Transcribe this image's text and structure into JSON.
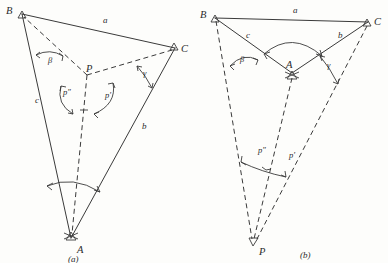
{
  "figure": {
    "background_color": "#fdfdfb",
    "ink_color": "#3a3a3a",
    "panels": [
      {
        "id": "a",
        "caption": "(a)",
        "description": "Triangle ABC with interior point P; angles p″ and p′ at P",
        "vertices": [
          {
            "name": "B",
            "label": "B",
            "x": 22,
            "y": 14
          },
          {
            "name": "C",
            "label": "C",
            "x": 175,
            "y": 48
          },
          {
            "name": "A",
            "label": "A",
            "x": 71,
            "y": 238
          },
          {
            "name": "P",
            "label": "P",
            "x": 87,
            "y": 75
          }
        ],
        "sides": [
          {
            "label": "a",
            "from": "B",
            "to": "C",
            "lx": 103,
            "ly": 23
          },
          {
            "label": "b",
            "from": "C",
            "to": "A",
            "lx": 142,
            "ly": 129
          },
          {
            "label": "c",
            "from": "B",
            "to": "A",
            "lx": 35,
            "ly": 103
          }
        ],
        "angles": [
          {
            "label": "β",
            "at": "B",
            "lx": 48,
            "ly": 63
          },
          {
            "label": "γ",
            "at": "C",
            "lx": 143,
            "ly": 76
          },
          {
            "label": "α",
            "at": "A",
            "lx": 0,
            "ly": 0
          }
        ],
        "point_angles": [
          {
            "label": "p″",
            "lx": 63,
            "ly": 95
          },
          {
            "label": "p′",
            "lx": 105,
            "ly": 98
          }
        ]
      },
      {
        "id": "b",
        "caption": "(b)",
        "description": "Triangle ABC with exterior point P below; angles p″ and p′ at P",
        "vertices": [
          {
            "name": "B",
            "label": "B",
            "x": 215,
            "y": 18
          },
          {
            "name": "C",
            "label": "C",
            "x": 368,
            "y": 22
          },
          {
            "name": "A",
            "label": "A",
            "x": 292,
            "y": 73
          },
          {
            "name": "P",
            "label": "P",
            "x": 253,
            "y": 243
          }
        ],
        "sides": [
          {
            "label": "a",
            "from": "B",
            "to": "C",
            "lx": 293,
            "ly": 13
          },
          {
            "label": "b",
            "from": "A",
            "to": "C",
            "lx": 338,
            "ly": 38
          },
          {
            "label": "c",
            "from": "B",
            "to": "A",
            "lx": 246,
            "ly": 38
          }
        ],
        "angles": [
          {
            "label": "β",
            "at": "B",
            "lx": 240,
            "ly": 62
          },
          {
            "label": "γ",
            "at": "C",
            "lx": 327,
            "ly": 68
          },
          {
            "label": "α",
            "at": "A",
            "lx": 0,
            "ly": 0
          }
        ],
        "point_angles": [
          {
            "label": "p″",
            "lx": 258,
            "ly": 153
          },
          {
            "label": "p′",
            "lx": 289,
            "ly": 158
          }
        ]
      }
    ]
  }
}
